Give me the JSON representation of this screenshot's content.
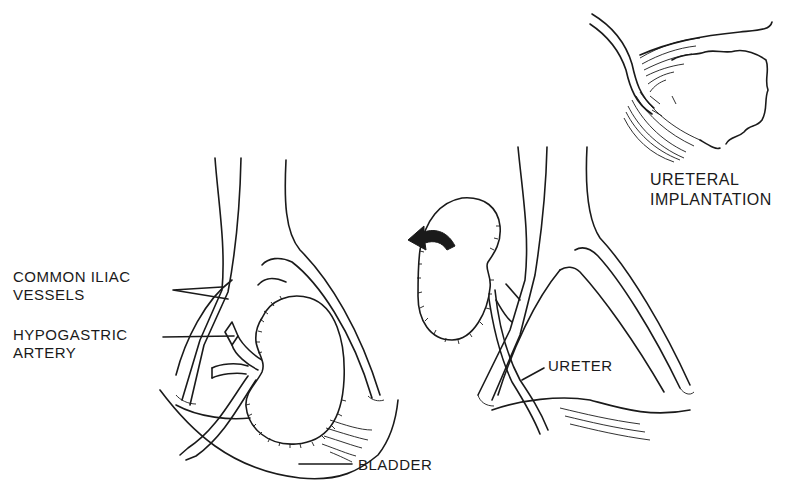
{
  "figure": {
    "type": "medical-illustration",
    "panels": [
      {
        "id": "left",
        "description": "kidney transplanted in iliac fossa with vessel anastomosis"
      },
      {
        "id": "right",
        "description": "kidney rotated with ureter routed to bladder"
      },
      {
        "id": "inset",
        "description": "ureteral implantation into bladder wall"
      }
    ]
  },
  "labels": {
    "common_iliac": [
      "COMMON ILIAC",
      "VESSELS"
    ],
    "hypogastric": [
      "HYPOGASTRIC",
      "ARTERY"
    ],
    "bladder": "BLADDER",
    "ureter": "URETER",
    "ureteral_implantation": [
      "URETERAL",
      "IMPLANTATION"
    ]
  },
  "icons": {
    "rotation_arrow": "curved-arrow-left"
  },
  "colors": {
    "ink": "#1a1a1a",
    "background": "#ffffff"
  }
}
